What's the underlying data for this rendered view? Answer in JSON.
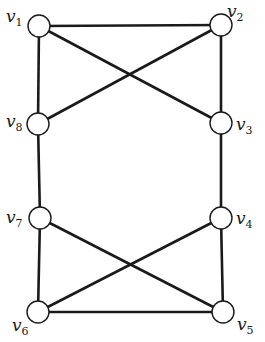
{
  "graph": {
    "nodes": [
      {
        "id": "v1",
        "label": "v",
        "sub": "1",
        "x": 39,
        "y": 26,
        "lx": 6,
        "ly": 22
      },
      {
        "id": "v2",
        "label": "v",
        "sub": "2",
        "x": 221,
        "y": 25,
        "lx": 227,
        "ly": 17
      },
      {
        "id": "v3",
        "label": "v",
        "sub": "3",
        "x": 221,
        "y": 123,
        "lx": 236,
        "ly": 130
      },
      {
        "id": "v4",
        "label": "v",
        "sub": "4",
        "x": 221,
        "y": 218,
        "lx": 236,
        "ly": 224
      },
      {
        "id": "v5",
        "label": "v",
        "sub": "5",
        "x": 223,
        "y": 312,
        "lx": 237,
        "ly": 330
      },
      {
        "id": "v6",
        "label": "v",
        "sub": "6",
        "x": 38,
        "y": 312,
        "lx": 12,
        "ly": 331
      },
      {
        "id": "v7",
        "label": "v",
        "sub": "7",
        "x": 40,
        "y": 218,
        "lx": 6,
        "ly": 223
      },
      {
        "id": "v8",
        "label": "v",
        "sub": "8",
        "x": 38,
        "y": 124,
        "lx": 6,
        "ly": 127
      }
    ],
    "edges": [
      [
        "v1",
        "v2"
      ],
      [
        "v1",
        "v8"
      ],
      [
        "v1",
        "v3"
      ],
      [
        "v2",
        "v8"
      ],
      [
        "v2",
        "v3"
      ],
      [
        "v8",
        "v7"
      ],
      [
        "v3",
        "v4"
      ],
      [
        "v7",
        "v6"
      ],
      [
        "v7",
        "v5"
      ],
      [
        "v4",
        "v6"
      ],
      [
        "v4",
        "v5"
      ],
      [
        "v6",
        "v5"
      ]
    ],
    "node_radius": 11
  }
}
